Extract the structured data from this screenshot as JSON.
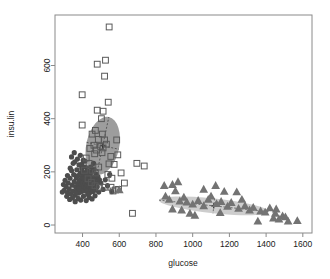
{
  "plot": {
    "background": "#ffffff",
    "box_color": "#888888",
    "frame": {
      "left": 55,
      "right": 312,
      "top": 15,
      "bottom": 233
    },
    "xaxis": {
      "label": "glucose",
      "ticks": [
        400,
        600,
        800,
        1000,
        1200,
        1400,
        1600
      ],
      "tick_labels": [
        "400",
        "600",
        "800",
        "1000",
        "1200",
        "1400",
        "1600"
      ],
      "range": [
        250,
        1650
      ]
    },
    "yaxis": {
      "label": "insu.lin",
      "ticks": [
        0,
        200,
        400,
        600
      ],
      "tick_labels": [
        "0",
        "200",
        "400",
        "600"
      ],
      "range": [
        -30,
        790
      ]
    }
  },
  "chart_data": {
    "type": "scatter",
    "title": "",
    "xlabel": "glucose",
    "ylabel": "insu.lin",
    "xlim": [
      250,
      1650
    ],
    "ylim": [
      -30,
      790
    ],
    "grid": false,
    "legend": "none",
    "series": [
      {
        "name": "cluster-1-circles",
        "marker": "filled-circle",
        "color": "#4d4d4d",
        "size": 2.6,
        "points": [
          [
            300,
            130
          ],
          [
            310,
            145
          ],
          [
            318,
            122
          ],
          [
            322,
            158
          ],
          [
            327,
            136
          ],
          [
            332,
            176
          ],
          [
            336,
            118
          ],
          [
            340,
            205
          ],
          [
            344,
            150
          ],
          [
            348,
            128
          ],
          [
            352,
            190
          ],
          [
            355,
            163
          ],
          [
            358,
            238
          ],
          [
            360,
            112
          ],
          [
            363,
            144
          ],
          [
            366,
            178
          ],
          [
            369,
            208
          ],
          [
            371,
            133
          ],
          [
            374,
            155
          ],
          [
            376,
            186
          ],
          [
            379,
            120
          ],
          [
            381,
            226
          ],
          [
            383,
            166
          ],
          [
            386,
            142
          ],
          [
            388,
            196
          ],
          [
            390,
            170
          ],
          [
            392,
            125
          ],
          [
            394,
            152
          ],
          [
            396,
            213
          ],
          [
            398,
            180
          ],
          [
            400,
            137
          ],
          [
            402,
            160
          ],
          [
            404,
            198
          ],
          [
            406,
            148
          ],
          [
            408,
            175
          ],
          [
            410,
            128
          ],
          [
            412,
            192
          ],
          [
            414,
            158
          ],
          [
            416,
            218
          ],
          [
            418,
            140
          ],
          [
            420,
            168
          ],
          [
            422,
            185
          ],
          [
            424,
            150
          ],
          [
            426,
            205
          ],
          [
            428,
            130
          ],
          [
            430,
            163
          ],
          [
            432,
            178
          ],
          [
            434,
            146
          ],
          [
            436,
            195
          ],
          [
            438,
            120
          ],
          [
            440,
            172
          ],
          [
            442,
            155
          ],
          [
            444,
            188
          ],
          [
            446,
            134
          ],
          [
            448,
            200
          ],
          [
            450,
            162
          ],
          [
            452,
            142
          ],
          [
            455,
            180
          ],
          [
            458,
            126
          ],
          [
            460,
            168
          ],
          [
            462,
            210
          ],
          [
            465,
            150
          ],
          [
            468,
            175
          ],
          [
            470,
            132
          ],
          [
            473,
            192
          ],
          [
            476,
            160
          ],
          [
            480,
            144
          ],
          [
            484,
            182
          ],
          [
            488,
            124
          ],
          [
            492,
            170
          ],
          [
            330,
            96
          ],
          [
            345,
            102
          ],
          [
            360,
            88
          ],
          [
            376,
            100
          ],
          [
            390,
            94
          ],
          [
            405,
            108
          ],
          [
            420,
            92
          ],
          [
            436,
            104
          ],
          [
            452,
            98
          ],
          [
            468,
            110
          ],
          [
            340,
            256
          ],
          [
            355,
            272
          ],
          [
            372,
            248
          ],
          [
            388,
            262
          ],
          [
            404,
            244
          ],
          [
            318,
            186
          ],
          [
            333,
            214
          ],
          [
            349,
            232
          ],
          [
            364,
            122
          ],
          [
            380,
            136
          ],
          [
            396,
            228
          ],
          [
            412,
            240
          ],
          [
            428,
            116
          ],
          [
            444,
            218
          ],
          [
            460,
            232
          ],
          [
            290,
            124
          ],
          [
            296,
            152
          ],
          [
            305,
            168
          ],
          [
            314,
            108
          ],
          [
            500,
            158
          ],
          [
            512,
            134
          ],
          [
            524,
            170
          ],
          [
            536,
            148
          ],
          [
            548,
            190
          ],
          [
            560,
            126
          ]
        ]
      },
      {
        "name": "cluster-2-squares",
        "marker": "open-square",
        "color": "#595959",
        "size": 4.2,
        "points": [
          [
            545,
            745
          ],
          [
            525,
            620
          ],
          [
            480,
            605
          ],
          [
            520,
            560
          ],
          [
            398,
            490
          ],
          [
            540,
            462
          ],
          [
            480,
            432
          ],
          [
            512,
            428
          ],
          [
            398,
            376
          ],
          [
            470,
            356
          ],
          [
            503,
            400
          ],
          [
            452,
            342
          ],
          [
            508,
            342
          ],
          [
            486,
            322
          ],
          [
            520,
            320
          ],
          [
            462,
            300
          ],
          [
            498,
            296
          ],
          [
            530,
            304
          ],
          [
            440,
            288
          ],
          [
            476,
            282
          ],
          [
            512,
            290
          ],
          [
            466,
            268
          ],
          [
            506,
            272
          ],
          [
            586,
            320
          ],
          [
            592,
            264
          ],
          [
            554,
            258
          ],
          [
            544,
            230
          ],
          [
            572,
            228
          ],
          [
            696,
            232
          ],
          [
            736,
            222
          ],
          [
            610,
            196
          ],
          [
            628,
            158
          ],
          [
            555,
            142
          ],
          [
            580,
            132
          ],
          [
            566,
            128
          ],
          [
            596,
            134
          ],
          [
            672,
            44
          ],
          [
            420,
            252
          ],
          [
            436,
            232
          ],
          [
            452,
            206
          ],
          [
            470,
            196
          ],
          [
            488,
            218
          ],
          [
            410,
            206
          ],
          [
            430,
            174
          ],
          [
            448,
            160
          ],
          [
            468,
            148
          ],
          [
            492,
            142
          ],
          [
            518,
            142
          ],
          [
            538,
            190
          ],
          [
            560,
            176
          ]
        ]
      },
      {
        "name": "cluster-3-triangles",
        "marker": "filled-triangle",
        "color": "#737373",
        "size": 4.0,
        "points": [
          [
            845,
            148
          ],
          [
            852,
            108
          ],
          [
            872,
            96
          ],
          [
            890,
            152
          ],
          [
            906,
            128
          ],
          [
            920,
            162
          ],
          [
            930,
            90
          ],
          [
            952,
            104
          ],
          [
            968,
            86
          ],
          [
            985,
            44
          ],
          [
            1000,
            78
          ],
          [
            1012,
            36
          ],
          [
            1030,
            92
          ],
          [
            1060,
            72
          ],
          [
            1085,
            96
          ],
          [
            1100,
            108
          ],
          [
            1125,
            148
          ],
          [
            1130,
            80
          ],
          [
            1155,
            88
          ],
          [
            1172,
            126
          ],
          [
            1190,
            70
          ],
          [
            1210,
            84
          ],
          [
            1240,
            124
          ],
          [
            1250,
            62
          ],
          [
            1285,
            72
          ],
          [
            1310,
            56
          ],
          [
            1330,
            66
          ],
          [
            1355,
            14
          ],
          [
            1370,
            52
          ],
          [
            1395,
            48
          ],
          [
            1420,
            64
          ],
          [
            1440,
            26
          ],
          [
            1455,
            60
          ],
          [
            1470,
            22
          ],
          [
            1490,
            34
          ],
          [
            1505,
            30
          ],
          [
            1520,
            14
          ],
          [
            1570,
            16
          ],
          [
            890,
            60
          ],
          [
            940,
            56
          ],
          [
            1060,
            134
          ],
          [
            1150,
            46
          ],
          [
            1268,
            96
          ],
          [
            1450,
            44
          ],
          [
            600,
            132
          ]
        ]
      }
    ],
    "ellipses": [
      {
        "name": "ellipse-cluster-squares",
        "center": [
          510,
          298
        ],
        "semi_major": 160,
        "semi_minor": 62,
        "angle_deg": -78,
        "fill": "#8c8c8c",
        "opacity": 0.85,
        "crosshair": true
      },
      {
        "name": "ellipse-cluster-triangles",
        "center": [
          1115,
          72
        ],
        "semi_major": 300,
        "semi_minor": 28,
        "angle_deg": 6,
        "fill": "#c8c8c8",
        "opacity": 0.9,
        "crosshair": true
      },
      {
        "name": "ellipse-cluster-circles",
        "center": [
          392,
          165
        ],
        "semi_major": 46,
        "semi_minor": 26,
        "angle_deg": -20,
        "fill": "#d9d9d9",
        "opacity": 0.85,
        "crosshair": true
      }
    ]
  }
}
